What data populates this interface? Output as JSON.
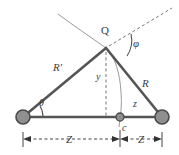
{
  "figure": {
    "type": "geometry-diagram",
    "background_color": "#ffffff",
    "title": ""
  },
  "labels": {
    "apex_point": "Q",
    "angle_left": "θ",
    "angle_apex": "φ",
    "side_left": "R′",
    "side_right": "R",
    "height": "y",
    "offset": "z",
    "center_point": "c",
    "dim_left": "Z",
    "dim_right": "Z"
  },
  "colors": {
    "triangle_stroke": "#555555",
    "baseline_stroke": "#555555",
    "node_fill": "#8f8f8f",
    "node_stroke": "#4a4a4a",
    "center_node_fill": "#8f8f8f",
    "dashed_stroke": "#777777",
    "curve_stroke": "#9a9a9a",
    "dimension_stroke": "#444444",
    "text": "#3c3c3c"
  },
  "geometry": {
    "left_node": {
      "x": 23,
      "y": 117,
      "r": 7
    },
    "right_node": {
      "x": 162,
      "y": 117,
      "r": 7
    },
    "center_node": {
      "x": 120,
      "y": 117,
      "r": 4
    },
    "apex": {
      "x": 106,
      "y": 48
    },
    "baseline_y": 117,
    "dimension_y": 139,
    "dim_left_span": [
      23,
      120
    ],
    "dim_right_span": [
      120,
      162
    ]
  },
  "elements": {
    "left_node_name": "mass-node-left",
    "right_node_name": "mass-node-right",
    "center_node_name": "center-node",
    "apex_name": "apex-point-q"
  }
}
